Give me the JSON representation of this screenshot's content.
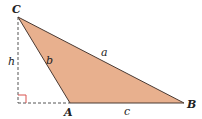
{
  "diagram": {
    "type": "triangle-with-altitude",
    "colors": {
      "fill": "#e8b08e",
      "stroke": "#4a3a33",
      "dashed": "#555555",
      "right_angle_marker": "#d9534f"
    },
    "vertices": [
      {
        "name": "C",
        "x": 18,
        "y": 17
      },
      {
        "name": "A",
        "x": 70,
        "y": 103
      },
      {
        "name": "B",
        "x": 184,
        "y": 103
      }
    ],
    "sides": [
      {
        "name": "a",
        "between": "C-B"
      },
      {
        "name": "b",
        "between": "C-A"
      },
      {
        "name": "c",
        "between": "A-B"
      }
    ],
    "altitude": {
      "label": "h",
      "from": "C",
      "foot": {
        "x": 18,
        "y": 103
      }
    },
    "labels": {
      "C": "C",
      "A": "A",
      "B": "B",
      "a": "a",
      "b": "b",
      "c": "c",
      "h": "h"
    }
  }
}
